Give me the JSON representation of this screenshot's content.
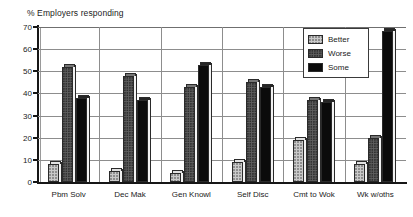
{
  "chart_data": {
    "type": "bar",
    "title": "% Employers responding",
    "xlabel": "",
    "ylabel": "",
    "ylim": [
      0,
      70
    ],
    "yticks": [
      0,
      10,
      20,
      30,
      40,
      50,
      60,
      70
    ],
    "grid": true,
    "legend_position": "top-right",
    "categories": [
      "Pbm Solv",
      "Dec Mak",
      "Gen Knowl",
      "Self Disc",
      "Cmt to Wok",
      "Wk w/oths"
    ],
    "series": [
      {
        "name": "Better",
        "color": "#c9c9c9",
        "values": [
          8,
          5,
          4,
          9,
          19,
          8
        ]
      },
      {
        "name": "Worse",
        "color": "#5e5e5e",
        "values": [
          52,
          48,
          43,
          45,
          37,
          20
        ]
      },
      {
        "name": "Some",
        "color": "#0b0b0b",
        "values": [
          38,
          37,
          53,
          43,
          36,
          68
        ]
      }
    ]
  },
  "legend": {
    "items": [
      {
        "label": "Better"
      },
      {
        "label": "Worse"
      },
      {
        "label": "Some"
      }
    ]
  }
}
